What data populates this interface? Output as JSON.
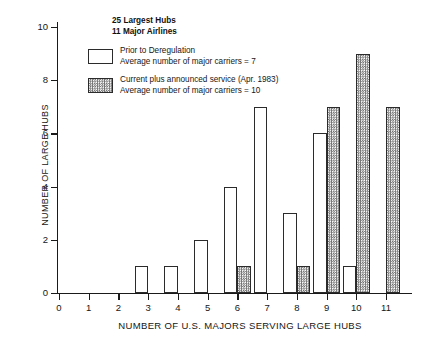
{
  "chart_data": {
    "type": "bar",
    "title": "",
    "xlabel": "NUMBER OF U.S. MAJORS SERVING LARGE HUBS",
    "ylabel": "NUMBER OF LARGE HUBS",
    "categories": [
      0,
      1,
      2,
      3,
      4,
      5,
      6,
      7,
      8,
      9,
      10,
      11
    ],
    "x_tick_labels": [
      "0",
      "1",
      "2",
      "3",
      "4",
      "5",
      "6",
      "7",
      "8",
      "9",
      "10",
      "11"
    ],
    "y_tick_labels": [
      "0",
      "2",
      "4",
      "6",
      "8",
      "10"
    ],
    "y_ticks": [
      0,
      2,
      4,
      6,
      8,
      10
    ],
    "ylim": [
      0,
      10
    ],
    "xlim": [
      0,
      11
    ],
    "grid": false,
    "legend_position": "upper-left-inside",
    "series": [
      {
        "name": "Prior to Deregulation",
        "fill": "open",
        "values": [
          0,
          0,
          0,
          1,
          1,
          2,
          4,
          7,
          3,
          6,
          1,
          0
        ]
      },
      {
        "name": "Current plus announced service (Apr. 1983)",
        "fill": "hatched",
        "values": [
          0,
          0,
          0,
          0,
          0,
          0,
          1,
          0,
          1,
          7,
          9,
          7
        ]
      }
    ],
    "annotations": [
      "25 Largest Hubs",
      "11 Major Airlines"
    ]
  },
  "note": {
    "line1": "25 Largest Hubs",
    "line2": "11 Major Airlines"
  },
  "legend": {
    "entries": [
      {
        "swatch": "open-box-swatch",
        "line1": "Prior to Deregulation",
        "line2": "Average number of major carriers = 7"
      },
      {
        "swatch": "hatched-box-swatch",
        "line1": "Current plus announced service (Apr. 1983)",
        "line2": "Average number of major carriers = 10"
      }
    ]
  },
  "colors": {
    "axis": "#1a1a1a",
    "bar_outline": "#2b2b2b",
    "bar_open_fill": "#ffffff",
    "bar_hatched_fill": "#6e6e6e",
    "background": "#ffffff"
  }
}
